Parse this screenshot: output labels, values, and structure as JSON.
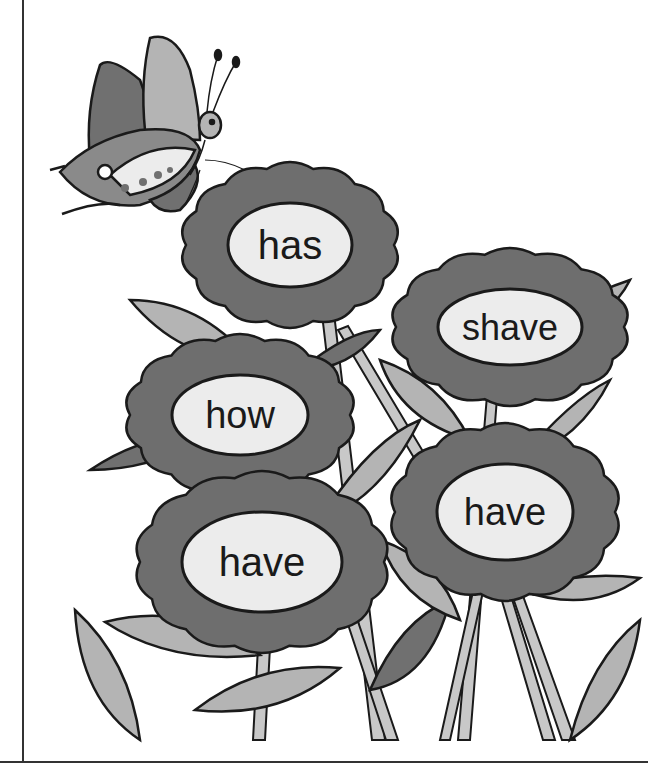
{
  "worksheet": {
    "flowers": [
      {
        "word": "has",
        "cx": 290,
        "cy": 245,
        "rx": 62,
        "ry": 42,
        "font": 40
      },
      {
        "word": "shave",
        "cx": 510,
        "cy": 327,
        "rx": 72,
        "ry": 38,
        "font": 36
      },
      {
        "word": "how",
        "cx": 240,
        "cy": 415,
        "rx": 68,
        "ry": 40,
        "font": 38
      },
      {
        "word": "have",
        "cx": 505,
        "cy": 512,
        "rx": 68,
        "ry": 48,
        "font": 38
      },
      {
        "word": "have",
        "cx": 262,
        "cy": 562,
        "rx": 80,
        "ry": 50,
        "font": 40
      }
    ],
    "colors": {
      "petal": "#6e6e6e",
      "center": "#ececec",
      "leaf_light": "#b4b4b4",
      "leaf_dark": "#707070",
      "stem": "#c8c8c8",
      "outline": "#1a1a1a"
    }
  }
}
